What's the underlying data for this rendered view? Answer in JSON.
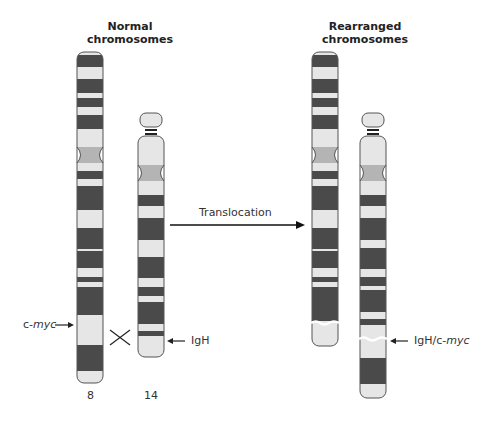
{
  "titles": {
    "normal": "Normal\nchromosomes",
    "normal_line1": "Normal",
    "normal_line2": "chromosomes",
    "rearranged_line1": "Rearranged",
    "rearranged_line2": "chromosomes"
  },
  "labels": {
    "cmyc_prefix": "c-",
    "cmyc_italic": "myc",
    "igh": "IgH",
    "igh_cmyc_prefix": "IgH/c-",
    "igh_cmyc_italic": "myc",
    "translocation": "Translocation",
    "chr8_number": "8",
    "chr14_number": "14"
  },
  "colors": {
    "dark_band": "#4a4a4a",
    "light_band": "#e6e6e6",
    "centromere": "#b4b4b4",
    "outline": "#555555",
    "text": "#333333"
  },
  "chromosomes": [
    {
      "id": "chr8-normal",
      "name": "Chromosome 8 (normal)"
    },
    {
      "id": "chr14-normal",
      "name": "Chromosome 14 (normal)"
    },
    {
      "id": "chr8-rearranged",
      "name": "Chromosome 8 (rearranged)"
    },
    {
      "id": "chr14-rearranged",
      "name": "Chromosome 14 (rearranged)"
    }
  ]
}
